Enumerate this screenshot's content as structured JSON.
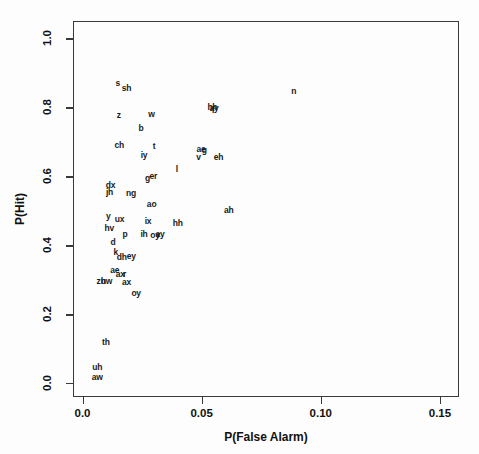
{
  "chart_data": {
    "type": "scatter",
    "title": "",
    "xlabel": "P(False Alarm)",
    "ylabel": "P(Hit)",
    "xlim": [
      -0.004,
      0.158
    ],
    "ylim": [
      -0.04,
      1.05
    ],
    "xticks": [
      "0.0",
      "0.05",
      "0.10",
      "0.15"
    ],
    "xtickvalues": [
      0.0,
      0.05,
      0.1,
      0.15
    ],
    "yticks": [
      "0.0",
      "0.2",
      "0.4",
      "0.6",
      "0.8",
      "1.0"
    ],
    "ytickvalues": [
      0.0,
      0.2,
      0.4,
      0.6,
      0.8,
      1.0
    ],
    "grid": false,
    "legend": null,
    "marker_style": "text-label",
    "points": [
      {
        "label": "s",
        "x": 0.0148,
        "y": 0.871
      },
      {
        "label": "sh",
        "x": 0.0185,
        "y": 0.855
      },
      {
        "label": "n",
        "x": 0.0886,
        "y": 0.848
      },
      {
        "label": "hh",
        "x": 0.0545,
        "y": 0.8
      },
      {
        "label": "ay",
        "x": 0.0552,
        "y": 0.797
      },
      {
        "label": "f",
        "x": 0.0548,
        "y": 0.793
      },
      {
        "label": "z",
        "x": 0.0152,
        "y": 0.778
      },
      {
        "label": "w",
        "x": 0.0289,
        "y": 0.78
      },
      {
        "label": "b",
        "x": 0.0245,
        "y": 0.739
      },
      {
        "label": "ch",
        "x": 0.0154,
        "y": 0.69
      },
      {
        "label": "t",
        "x": 0.03,
        "y": 0.688
      },
      {
        "label": "ae",
        "x": 0.0497,
        "y": 0.679
      },
      {
        "label": "g",
        "x": 0.0511,
        "y": 0.676
      },
      {
        "label": "iy",
        "x": 0.0258,
        "y": 0.661
      },
      {
        "label": "v",
        "x": 0.0487,
        "y": 0.655
      },
      {
        "label": "eh",
        "x": 0.0571,
        "y": 0.657
      },
      {
        "label": "l",
        "x": 0.0396,
        "y": 0.62
      },
      {
        "label": "g",
        "x": 0.0273,
        "y": 0.596
      },
      {
        "label": "er",
        "x": 0.0297,
        "y": 0.6
      },
      {
        "label": "dx",
        "x": 0.0117,
        "y": 0.574
      },
      {
        "label": "jh",
        "x": 0.0113,
        "y": 0.553
      },
      {
        "label": "ng",
        "x": 0.0203,
        "y": 0.551
      },
      {
        "label": "ao",
        "x": 0.029,
        "y": 0.519
      },
      {
        "label": "ah",
        "x": 0.0614,
        "y": 0.501
      },
      {
        "label": "y",
        "x": 0.0108,
        "y": 0.484
      },
      {
        "label": "ux",
        "x": 0.0155,
        "y": 0.477
      },
      {
        "label": "ix",
        "x": 0.0275,
        "y": 0.469
      },
      {
        "label": "hh",
        "x": 0.04,
        "y": 0.464
      },
      {
        "label": "hv",
        "x": 0.0112,
        "y": 0.449
      },
      {
        "label": "p",
        "x": 0.0178,
        "y": 0.432
      },
      {
        "label": "ih",
        "x": 0.0258,
        "y": 0.433
      },
      {
        "label": "oy",
        "x": 0.0304,
        "y": 0.431
      },
      {
        "label": "ay",
        "x": 0.0325,
        "y": 0.433
      },
      {
        "label": "r",
        "x": 0.0318,
        "y": 0.43
      },
      {
        "label": "d",
        "x": 0.0128,
        "y": 0.41
      },
      {
        "label": "k",
        "x": 0.014,
        "y": 0.381
      },
      {
        "label": "dh",
        "x": 0.0165,
        "y": 0.367
      },
      {
        "label": "ey",
        "x": 0.0205,
        "y": 0.369
      },
      {
        "label": "ae",
        "x": 0.0135,
        "y": 0.327
      },
      {
        "label": "ax",
        "x": 0.0158,
        "y": 0.318
      },
      {
        "label": "r",
        "x": 0.0176,
        "y": 0.317
      },
      {
        "label": "zh",
        "x": 0.0078,
        "y": 0.296
      },
      {
        "label": "uw",
        "x": 0.01,
        "y": 0.296
      },
      {
        "label": "ax",
        "x": 0.0185,
        "y": 0.293
      },
      {
        "label": "oy",
        "x": 0.0225,
        "y": 0.262
      },
      {
        "label": "th",
        "x": 0.0098,
        "y": 0.118
      },
      {
        "label": "uh",
        "x": 0.0062,
        "y": 0.046
      },
      {
        "label": "aw",
        "x": 0.0062,
        "y": 0.018
      }
    ]
  },
  "figure": {
    "background_color": "#ffffff",
    "axis_color": "#3a3a3a",
    "text_color": "#111111"
  }
}
